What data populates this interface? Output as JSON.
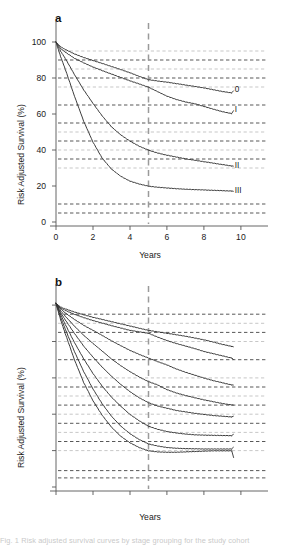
{
  "figure": {
    "background": "#ffffff",
    "axis_color": "#555555",
    "gridline_color_dark": "#3a3a3a",
    "gridline_color_light": "#b9b9b9",
    "marker_line_color": "#9a9a9a",
    "curve_color": "#333333",
    "caption_partial": "Fig. 1 Risk adjusted survival curves by stage grouping for the study cohort"
  },
  "panels": [
    {
      "id": "a",
      "letter": "a",
      "chart_data": {
        "type": "line",
        "title": "a",
        "xlabel": "Years",
        "ylabel": "Risk Adjusted Survival (%)",
        "xlim": [
          0,
          10.6
        ],
        "ylim": [
          0,
          105
        ],
        "xticks": [
          0,
          2,
          4,
          6,
          8,
          10
        ],
        "xticklabels": [
          "0",
          "2",
          "4",
          "6",
          "8",
          "10"
        ],
        "yticks": [
          0,
          20,
          40,
          60,
          80,
          100
        ],
        "yticklabels": [
          "0",
          "20",
          "40",
          "60",
          "80",
          "100"
        ],
        "grid": true,
        "gridlines_dark": [
          90,
          80,
          65,
          55,
          45,
          35,
          10,
          5
        ],
        "gridlines_light": [
          95,
          85,
          75,
          50,
          40,
          30
        ],
        "vertical_marker": {
          "x": 5,
          "style": "dashed",
          "color": "#9a9a9a"
        },
        "legend_position": "right-inline",
        "series": [
          {
            "name": "0",
            "label": "0",
            "label_y": 73,
            "x": [
              0,
              0.25,
              0.5,
              1,
              1.5,
              2,
              2.5,
              3,
              3.5,
              4,
              4.5,
              5,
              5.5,
              6,
              6.5,
              7,
              7.5,
              8,
              8.5,
              9,
              9.5
            ],
            "values": [
              100,
              97.5,
              96.0,
              93.5,
              91.5,
              89.8,
              88.2,
              86.5,
              84.8,
              83.0,
              81.0,
              79.2,
              78.4,
              77.8,
              77.0,
              76.2,
              75.4,
              74.6,
              73.6,
              72.6,
              71.8
            ]
          },
          {
            "name": "I",
            "label": "I",
            "label_y": 62,
            "x": [
              0,
              0.25,
              0.5,
              1,
              1.5,
              2,
              2.5,
              3,
              3.5,
              4,
              4.5,
              5,
              5.5,
              6,
              6.5,
              7,
              7.5,
              8,
              8.5,
              9,
              9.5
            ],
            "values": [
              100,
              96.5,
              94.5,
              91.0,
              88.5,
              86.2,
              84.2,
              82.3,
              80.4,
              78.5,
              76.8,
              75.0,
              72.5,
              70.0,
              68.2,
              66.8,
              65.8,
              64.3,
              62.8,
              61.4,
              60.3
            ]
          },
          {
            "name": "II",
            "label": "II",
            "label_y": 31,
            "x": [
              0,
              0.25,
              0.5,
              1,
              1.5,
              2,
              2.5,
              3,
              3.5,
              4,
              4.5,
              5,
              5.5,
              6,
              6.5,
              7,
              7.5,
              8,
              8.5,
              9,
              9.5
            ],
            "values": [
              100,
              95.0,
              91.0,
              82.0,
              73.5,
              66.0,
              59.0,
              53.0,
              48.5,
              45.0,
              42.2,
              40.0,
              38.4,
              37.2,
              36.2,
              35.2,
              34.4,
              33.6,
              32.8,
              32.0,
              31.2
            ]
          },
          {
            "name": "III",
            "label": "III",
            "label_y": 17,
            "x": [
              0,
              0.25,
              0.5,
              1,
              1.5,
              2,
              2.5,
              3,
              3.5,
              4,
              4.5,
              5,
              5.5,
              6,
              6.5,
              7,
              7.5,
              8,
              8.5,
              9,
              9.5
            ],
            "values": [
              100,
              92.0,
              85.0,
              70.0,
              56.0,
              44.5,
              35.5,
              29.5,
              25.5,
              22.8,
              21.2,
              20.0,
              19.4,
              19.0,
              18.6,
              18.3,
              18.1,
              17.9,
              17.7,
              17.5,
              17.3
            ]
          }
        ]
      }
    },
    {
      "id": "b",
      "letter": "b",
      "chart_data": {
        "type": "line",
        "title": "b",
        "xlabel": "Years",
        "ylabel": "Risk Adjusted Survival (%)",
        "xlim": [
          0,
          10.6
        ],
        "ylim": [
          0,
          105
        ],
        "xticks": [
          0,
          2,
          4,
          6,
          8,
          10
        ],
        "xticklabels": [
          "0",
          "2",
          "4",
          "6",
          "8",
          "10"
        ],
        "yticks": [
          0,
          20,
          40,
          60,
          80,
          100
        ],
        "yticklabels": [
          "0",
          "20",
          "40",
          "60",
          "80",
          "100"
        ],
        "grid": true,
        "gridlines_dark": [
          95,
          85,
          70,
          55,
          45,
          35,
          25,
          9,
          5
        ],
        "gridlines_light": [
          90,
          80,
          60,
          50,
          40,
          30,
          20
        ],
        "vertical_marker": {
          "x": 5,
          "style": "dashed",
          "color": "#9a9a9a"
        },
        "legend_position": "right-inline",
        "series": [
          {
            "name": "0",
            "label": "0",
            "label_y": 77,
            "x": [
              0,
              0.25,
              0.5,
              1,
              1.5,
              2,
              2.5,
              3,
              3.5,
              4,
              4.5,
              5,
              5.5,
              6,
              6.5,
              7,
              7.5,
              8,
              8.5,
              9,
              9.5
            ],
            "values": [
              101,
              99.0,
              98.0,
              96.3,
              94.8,
              93.4,
              92.2,
              91.0,
              89.8,
              88.6,
              87.4,
              86.2,
              85.4,
              84.6,
              83.8,
              83.0,
              82.0,
              81.0,
              79.8,
              78.5,
              77.4
            ]
          },
          {
            "name": "IA",
            "label": "IA",
            "label_y": 70,
            "x": [
              0,
              0.25,
              0.5,
              1,
              1.5,
              2,
              2.5,
              3,
              3.5,
              4,
              4.5,
              5,
              5.5,
              6,
              6.5,
              7,
              7.5,
              8,
              8.5,
              9,
              9.5
            ],
            "values": [
              101,
              98.5,
              97.2,
              95.0,
              93.2,
              91.6,
              90.2,
              88.8,
              87.5,
              86.2,
              85.4,
              84.6,
              82.5,
              80.6,
              79.0,
              77.6,
              76.2,
              74.6,
              73.4,
              72.2,
              71.0
            ]
          },
          {
            "name": "IB",
            "label": "IB",
            "label_y": 56,
            "x": [
              0,
              0.25,
              0.5,
              1,
              1.5,
              2,
              2.5,
              3,
              3.5,
              4,
              4.5,
              5,
              5.5,
              6,
              6.5,
              7,
              7.5,
              8,
              8.5,
              9,
              9.5
            ],
            "values": [
              101,
              98.0,
              95.8,
              92.2,
              89.0,
              86.2,
              83.4,
              80.5,
              77.8,
              75.2,
              73.0,
              71.0,
              69.0,
              67.2,
              65.0,
              63.2,
              61.6,
              60.0,
              58.6,
              57.4,
              56.2
            ]
          },
          {
            "name": "IIA",
            "label": "IIA",
            "label_y": 45,
            "x": [
              0,
              0.25,
              0.5,
              1,
              1.5,
              2,
              2.5,
              3,
              3.5,
              4,
              4.5,
              5,
              5.5,
              6,
              6.5,
              7,
              7.5,
              8,
              8.5,
              9,
              9.5
            ],
            "values": [
              101,
              97.0,
              94.0,
              88.5,
              83.5,
              79.0,
              74.8,
              70.5,
              66.8,
              63.5,
              60.6,
              58.0,
              56.2,
              53.6,
              51.8,
              50.4,
              49.2,
              48.0,
              47.0,
              46.0,
              45.2
            ]
          },
          {
            "name": "IIB",
            "label": "IIB",
            "label_y": 39,
            "x": [
              0,
              0.25,
              0.5,
              1,
              1.5,
              2,
              2.5,
              3,
              3.5,
              4,
              4.5,
              5,
              5.5,
              6,
              6.5,
              7,
              7.5,
              8,
              8.5,
              9,
              9.5
            ],
            "values": [
              101,
              96.0,
              92.0,
              84.5,
              77.5,
              71.5,
              66.0,
              61.0,
              56.5,
              52.5,
              49.2,
              46.4,
              44.6,
              43.4,
              42.2,
              41.4,
              40.6,
              40.0,
              39.4,
              39.0,
              38.6
            ]
          },
          {
            "name": "IIIA",
            "label": "IIIA",
            "label_y": 29,
            "x": [
              0,
              0.25,
              0.5,
              1,
              1.5,
              2,
              2.5,
              3,
              3.5,
              4,
              4.5,
              5,
              5.5,
              6,
              6.5,
              7,
              7.5,
              8,
              8.5,
              9,
              9.5
            ],
            "values": [
              101,
              95.0,
              89.5,
              79.5,
              70.5,
              62.5,
              55.5,
              49.5,
              44.5,
              40.0,
              36.5,
              33.5,
              31.8,
              30.6,
              29.8,
              29.2,
              28.8,
              28.6,
              28.5,
              28.4,
              28.3
            ]
          },
          {
            "name": "IIIB",
            "label": "IIIB",
            "label_y": 22,
            "x": [
              0,
              0.25,
              0.5,
              1,
              1.5,
              2,
              2.5,
              3,
              3.5,
              4,
              4.5,
              5,
              5.5,
              6,
              6.5,
              7,
              7.5,
              8,
              8.5,
              9,
              9.5
            ],
            "values": [
              101,
              93.5,
              87.0,
              74.5,
              63.5,
              54.0,
              45.8,
              39.0,
              33.6,
              29.4,
              26.2,
              23.8,
              22.6,
              21.8,
              21.4,
              21.2,
              21.1,
              21.0,
              21.0,
              21.0,
              21.0
            ]
          },
          {
            "name": "IIIC",
            "label": "IIIC",
            "label_y": 16,
            "x": [
              0,
              0.25,
              0.5,
              1,
              1.5,
              2,
              2.5,
              3,
              3.5,
              4,
              4.5,
              5,
              5.5,
              6,
              6.5,
              7,
              7.5,
              8,
              8.5,
              9,
              9.5
            ],
            "values": [
              101,
              92.0,
              84.5,
              70.0,
              57.5,
              47.5,
              39.5,
              33.0,
              28.0,
              24.4,
              21.8,
              20.0,
              19.4,
              19.2,
              19.2,
              19.4,
              19.6,
              19.8,
              20.0,
              20.0,
              20.0
            ]
          }
        ]
      }
    }
  ]
}
